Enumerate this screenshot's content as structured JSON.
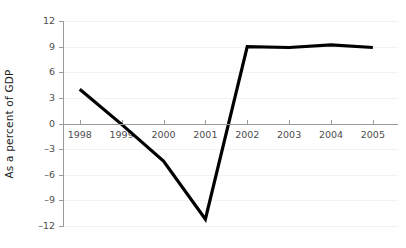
{
  "chart_data": {
    "type": "line",
    "title": "",
    "xlabel": "",
    "ylabel": "As a percent of GDP",
    "categories": [
      "1998",
      "1999",
      "2000",
      "2001",
      "2002",
      "2003",
      "2004",
      "2005"
    ],
    "x": [
      1998,
      1999,
      2000,
      2001,
      2002,
      2003,
      2004,
      2005
    ],
    "values": [
      4.0,
      -0.1,
      -4.4,
      -11.2,
      9.0,
      8.9,
      9.2,
      8.9
    ],
    "series": [
      {
        "name": "",
        "values": [
          4.0,
          -0.1,
          -4.4,
          -11.2,
          9.0,
          8.9,
          9.2,
          8.9
        ],
        "color": "#000000"
      }
    ],
    "ylim": [
      -12,
      12
    ],
    "yticks": [
      12,
      9,
      6,
      3,
      0,
      -3,
      -6,
      -9,
      -12
    ],
    "ytick_labels": [
      "12",
      "9",
      "6",
      "3",
      "0",
      "–3",
      "–6",
      "–9",
      "–12"
    ],
    "xlim": [
      1997.6,
      2005.6
    ],
    "grid": true,
    "legend": null,
    "legend_position": "none",
    "line_color": "#000000",
    "grid_color": "#f2f2f2",
    "axis_color": "#9a9a9a",
    "background_color": "#ffffff",
    "zero_axis": true
  }
}
